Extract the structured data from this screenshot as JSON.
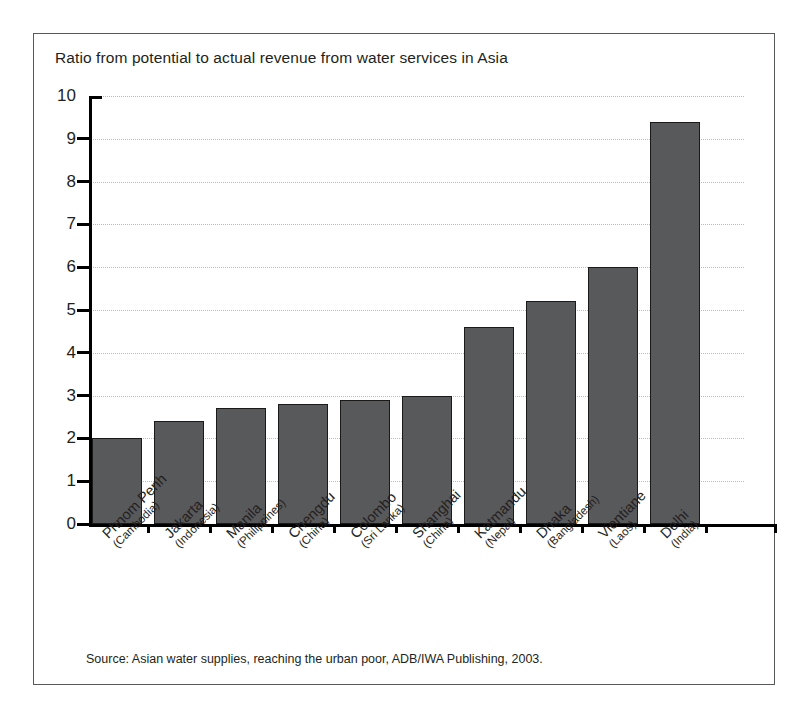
{
  "figure": {
    "title": "Ratio from potential to actual revenue from water services in Asia",
    "source": "Source: Asian water supplies, reaching the urban poor, ADB/IWA Publishing, 2003.",
    "frame_color": "#58595b",
    "bar_color": "#58595b",
    "bar_edge_color": "#1a1a1a",
    "grid_color": "#b9babc",
    "axis_color": "#000000",
    "text_color": "#231f20"
  },
  "chart_data": {
    "type": "bar",
    "title": "Ratio from potential to actual revenue from water services in Asia",
    "xlabel": "",
    "ylabel": "",
    "ylim": [
      0,
      10
    ],
    "yticks": [
      0,
      1,
      2,
      3,
      4,
      5,
      6,
      7,
      8,
      9,
      10
    ],
    "ytick_labels": [
      "0",
      "1",
      "2",
      "3",
      "4",
      "5",
      "6",
      "7",
      "8",
      "9",
      "10"
    ],
    "grid": "horizontal-dotted",
    "legend": "none",
    "orientation": "vertical",
    "categories": [
      "Phnom Penh (Cambodia)",
      "Jakarta (Indonesia)",
      "Manila (Philippines)",
      "Chengdu (China)",
      "Colombo (Sri Lanka)",
      "Shanghai (China)",
      "Katmandu (Nepal)",
      "Dhaka (Bangladesh)",
      "Vientiane (Laos)",
      "Delhi (India)"
    ],
    "category_parts": [
      {
        "city": "Phnom Penh",
        "country": "(Cambodia)"
      },
      {
        "city": "Jakarta",
        "country": "(Indonesia)"
      },
      {
        "city": "Manila",
        "country": "(Philippines)"
      },
      {
        "city": "Chengdu",
        "country": "(China)"
      },
      {
        "city": "Colombo",
        "country": "(Sri Lanka)"
      },
      {
        "city": "Shanghai",
        "country": "(China)"
      },
      {
        "city": "Katmandu",
        "country": "(Nepal)"
      },
      {
        "city": "Dhaka",
        "country": "(Bangladesh)"
      },
      {
        "city": "Vientiane",
        "country": "(Laos)"
      },
      {
        "city": "Delhi",
        "country": "(India)"
      }
    ],
    "values": [
      2.0,
      2.4,
      2.7,
      2.8,
      2.9,
      3.0,
      4.6,
      5.2,
      6.0,
      9.4
    ]
  }
}
